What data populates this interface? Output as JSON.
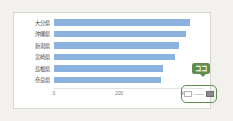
{
  "chart_data": {
    "type": "bar",
    "orientation": "horizontal",
    "title": "",
    "xlabel": "",
    "ylabel": "",
    "categories": [
      "大分県",
      "沖縄県",
      "新潟県",
      "宮崎県",
      "島根県",
      "奈良県"
    ],
    "values": [
      413,
      400,
      378,
      365,
      330,
      325
    ],
    "xticks": [
      "0",
      "200",
      "400"
    ],
    "xtick_values": [
      0,
      200,
      400
    ],
    "xlim": [
      0,
      460
    ],
    "grid": false,
    "legend": null,
    "series": [
      {
        "name": "",
        "values": [
          413,
          400,
          378,
          365,
          330,
          325
        ]
      }
    ],
    "bar_color": "#8cb2e0"
  },
  "annotations": {
    "callout": {
      "text": "ココ",
      "color": "#ffffff",
      "background": "#5f8d4e"
    },
    "highlight": {
      "border_color": "#5f8d4e"
    }
  },
  "page": {
    "background": "#f3f1ed",
    "card_background": "#ffffff",
    "card_border": "#d8d6d2"
  }
}
